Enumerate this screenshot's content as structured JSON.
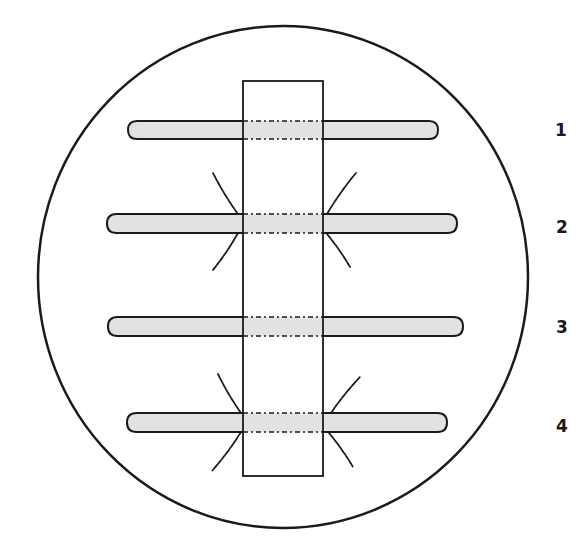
{
  "figure": {
    "width": 585,
    "height": 538,
    "colors": {
      "stroke": "#1a1a1a",
      "bar_fill": "#e2e2e2",
      "background": "#ffffff"
    },
    "field_of_view": {
      "cx": 283,
      "cy": 277,
      "rx": 245,
      "ry": 251
    },
    "slide": {
      "x1": 243,
      "y1": 81,
      "x2": 323,
      "y2": 476
    },
    "bars": [
      {
        "id": "1",
        "label": "1",
        "x1": 128,
        "x2": 438,
        "y1": 121,
        "y2": 139,
        "cracks": false,
        "label_x": 561,
        "label_y": 130
      },
      {
        "id": "2",
        "label": "2",
        "x1": 107,
        "x2": 457,
        "y1": 214,
        "y2": 233,
        "cracks": true,
        "label_x": 562,
        "label_y": 227
      },
      {
        "id": "3",
        "label": "3",
        "x1": 108,
        "x2": 463,
        "y1": 317,
        "y2": 336,
        "cracks": false,
        "label_x": 562,
        "label_y": 327
      },
      {
        "id": "4",
        "label": "4",
        "x1": 127,
        "x2": 447,
        "y1": 413,
        "y2": 432,
        "cracks": true,
        "label_x": 562,
        "label_y": 426
      }
    ],
    "cracks": {
      "2": [
        [
          [
            238,
            214
          ],
          [
            213,
            173
          ]
        ],
        [
          [
            238,
            233
          ],
          [
            213,
            270
          ]
        ],
        [
          [
            327,
            214
          ],
          [
            356,
            173
          ]
        ],
        [
          [
            327,
            234
          ],
          [
            350,
            267
          ]
        ]
      ],
      "4": [
        [
          [
            241,
            413
          ],
          [
            218,
            374
          ]
        ],
        [
          [
            241,
            432
          ],
          [
            212,
            471
          ]
        ],
        [
          [
            331,
            413
          ],
          [
            360,
            377
          ]
        ],
        [
          [
            329,
            433
          ],
          [
            353,
            467
          ]
        ]
      ]
    }
  }
}
